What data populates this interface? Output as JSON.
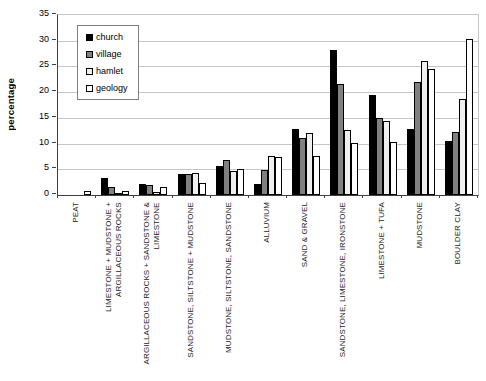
{
  "chart_data": {
    "type": "bar",
    "title": "",
    "xlabel": "",
    "ylabel": "percentage",
    "ylim": [
      0,
      35
    ],
    "ytick_step": 5,
    "yticks": [
      0,
      5,
      10,
      15,
      20,
      25,
      30,
      35
    ],
    "grid": true,
    "legend_position": "top-left-inside",
    "categories": [
      "PEAT",
      "LIMESTONE + MUDSTONE +\nARGILLACEOUS ROCKS",
      "ARGILLACEOUS ROCKS + SANDSTONE &\nLIMESTONE",
      "SANDSTONE, SILTSTONE + MUDSTONE",
      "MUDSTONE, SILTSTONE, SANDSTONE",
      "ALLUVIUM",
      "SAND & GRAVEL",
      "SANDSTONE, LIMESTONE, IRONSTONE",
      "LIMESTONE + TUFA",
      "MUDSTONE",
      "BOULDER CLAY"
    ],
    "series": [
      {
        "name": "church",
        "color": "#000000",
        "values": [
          0,
          3.3,
          2.2,
          4.0,
          5.7,
          2.1,
          12.9,
          28.2,
          19.4,
          12.9,
          10.5
        ]
      },
      {
        "name": "village",
        "color": "#808080",
        "values": [
          0,
          1.6,
          1.9,
          4.1,
          6.8,
          4.8,
          11.0,
          21.5,
          15.0,
          22.0,
          12.2
        ]
      },
      {
        "name": "hamlet",
        "color": "#efefef",
        "values": [
          0,
          0.4,
          0.6,
          4.3,
          4.6,
          7.6,
          12.0,
          12.6,
          14.4,
          26.0,
          18.7
        ]
      },
      {
        "name": "geology",
        "color": "#ffffff",
        "values": [
          0.8,
          0.8,
          1.5,
          2.3,
          5.1,
          7.4,
          7.6,
          10.2,
          10.4,
          24.5,
          30.3
        ]
      }
    ],
    "colors": {
      "bar_border": "#000000",
      "gridline": "#c6c6c6",
      "axis": "#404040",
      "background": "#ffffff"
    }
  }
}
